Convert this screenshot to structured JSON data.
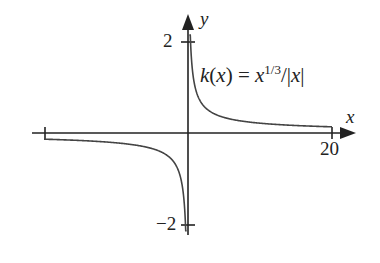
{
  "chart_data": {
    "type": "line",
    "title": "",
    "function_label": "k(x) = x^{1/3}/|x|",
    "xlabel": "x",
    "ylabel": "y",
    "x_ticks": [
      -20,
      20
    ],
    "x_tick_labels": [
      "",
      "20"
    ],
    "y_ticks": [
      -2,
      2
    ],
    "y_tick_labels": [
      "−2",
      "2"
    ],
    "xlim": [
      -22,
      22
    ],
    "ylim": [
      -2.2,
      2.2
    ],
    "grid": false,
    "legend": "none",
    "series": [
      {
        "name": "k(x)",
        "formula": "x^(1/3)/|x|",
        "domain": "x != 0",
        "x": [
          -20,
          -10,
          -5,
          -2,
          -1,
          -0.5,
          -0.2,
          0.2,
          0.5,
          1,
          2,
          5,
          10,
          20
        ],
        "y": [
          -0.136,
          -0.215,
          -0.342,
          -0.63,
          -1.0,
          -1.587,
          -2.0,
          2.0,
          1.587,
          1.0,
          0.63,
          0.342,
          0.215,
          0.136
        ]
      }
    ]
  },
  "labels": {
    "y_axis": "y",
    "x_axis": "x",
    "tick_2": "2",
    "tick_neg2": "−2",
    "tick_20": "20",
    "fn_k": "k",
    "fn_open": "(",
    "fn_x": "x",
    "fn_close": ")",
    "fn_eq": " = ",
    "fn_x2": "x",
    "fn_exp": "1/3",
    "fn_div": "/|",
    "fn_x3": "x",
    "fn_bar": "|"
  }
}
